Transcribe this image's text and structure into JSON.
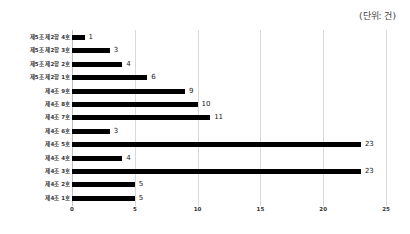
{
  "unit_label": "(단위: 건)",
  "chart_data": {
    "type": "bar",
    "orientation": "horizontal",
    "title": "",
    "unit": "(단위: 건)",
    "xlabel": "",
    "ylabel": "",
    "xlim": [
      0,
      25
    ],
    "x_ticks": [
      0,
      5,
      10,
      15,
      20,
      25
    ],
    "grid": true,
    "legend": "none",
    "bar_color": "#000000",
    "categories": [
      "제5조 제2항 4호",
      "제5조 제2항 3호",
      "제5조 제2항 2호",
      "제5조 제2항 1호",
      "제4조 9호",
      "제4조 8호",
      "제4조 7호",
      "제4조 6호",
      "제4조 5호",
      "제4조 4호",
      "제4조 3호",
      "제4조 2호",
      "제4조 1호"
    ],
    "values": [
      1,
      3,
      4,
      6,
      9,
      10,
      11,
      3,
      23,
      4,
      23,
      5,
      5
    ]
  }
}
